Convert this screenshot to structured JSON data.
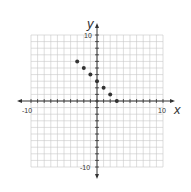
{
  "chart_data": {
    "type": "scatter",
    "title": "",
    "xlabel": "x",
    "ylabel": "y",
    "xlim": [
      -10,
      10
    ],
    "ylim": [
      -10,
      10
    ],
    "grid": true,
    "tick_labels": {
      "x_min": "-10",
      "x_max": "10",
      "y_max": "10",
      "y_min": "-10"
    },
    "points": [
      {
        "x": -3,
        "y": 6
      },
      {
        "x": -2,
        "y": 5
      },
      {
        "x": -1,
        "y": 4
      },
      {
        "x": 0,
        "y": 3
      },
      {
        "x": 1,
        "y": 2
      },
      {
        "x": 2,
        "y": 1
      },
      {
        "x": 3,
        "y": 0
      }
    ]
  },
  "colors": {
    "grid": "#c8c8c8",
    "axis": "#333333",
    "point": "#333333"
  }
}
